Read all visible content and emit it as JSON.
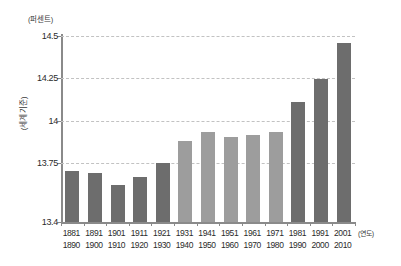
{
  "chart_data": {
    "type": "bar",
    "title": "",
    "subtitle": "",
    "unit_label": "(퍼센트)",
    "ylabel": "(세계 기준)",
    "xlabel": "(연도)",
    "ylim": [
      13.4,
      14.5
    ],
    "ytick_labels": [
      "14.5",
      "14.25",
      "14",
      "13.75",
      "13.4"
    ],
    "ytick_values": [
      14.5,
      14.25,
      14.0,
      13.75,
      13.4
    ],
    "grid": true,
    "legend": "none",
    "categories": [
      "1881\n1890",
      "1891\n1900",
      "1901\n1910",
      "1911\n1920",
      "1921\n1930",
      "1931\n1940",
      "1941\n1950",
      "1951\n1960",
      "1961\n1970",
      "1971\n1980",
      "1981\n1990",
      "1991\n2000",
      "2001\n2010"
    ],
    "bars": [
      {
        "start": "1881",
        "end": "1890",
        "value": 13.7,
        "group": "dark"
      },
      {
        "start": "1891",
        "end": "1900",
        "value": 13.69,
        "group": "dark"
      },
      {
        "start": "1901",
        "end": "1910",
        "value": 13.62,
        "group": "dark"
      },
      {
        "start": "1911",
        "end": "1920",
        "value": 13.665,
        "group": "dark"
      },
      {
        "start": "1921",
        "end": "1930",
        "value": 13.75,
        "group": "dark"
      },
      {
        "start": "1931",
        "end": "1940",
        "value": 13.88,
        "group": "light"
      },
      {
        "start": "1941",
        "end": "1950",
        "value": 13.93,
        "group": "light"
      },
      {
        "start": "1951",
        "end": "1960",
        "value": 13.905,
        "group": "light"
      },
      {
        "start": "1961",
        "end": "1970",
        "value": 13.915,
        "group": "light"
      },
      {
        "start": "1971",
        "end": "1980",
        "value": 13.93,
        "group": "light"
      },
      {
        "start": "1981",
        "end": "1990",
        "value": 14.11,
        "group": "dark"
      },
      {
        "start": "1991",
        "end": "2000",
        "value": 14.245,
        "group": "dark"
      },
      {
        "start": "2001",
        "end": "2010",
        "value": 14.46,
        "group": "dark"
      }
    ],
    "colors": {
      "bar_dark": "#6d6d6d",
      "bar_light": "#9d9d9d",
      "axis": "#8a8a8a",
      "grid": "#c2c2c2",
      "text": "#2b2b2b",
      "background": "#ffffff"
    }
  }
}
